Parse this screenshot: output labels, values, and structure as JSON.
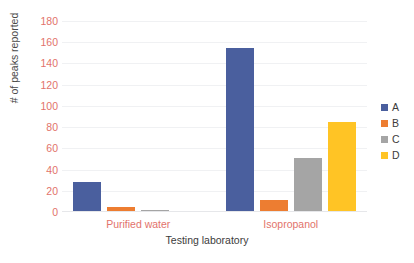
{
  "chart_data": {
    "type": "bar",
    "title": "",
    "xlabel": "Testing laboratory",
    "ylabel": "# of peaks reported",
    "categories": [
      "Purified water",
      "Isopropanol"
    ],
    "series": [
      {
        "name": "A",
        "color": "#4a5f9e",
        "values": [
          28,
          155
        ]
      },
      {
        "name": "B",
        "color": "#ed7d31",
        "values": [
          5,
          11
        ]
      },
      {
        "name": "C",
        "color": "#a5a5a5",
        "values": [
          1.5,
          51
        ]
      },
      {
        "name": "D",
        "color": "#ffc425",
        "values": [
          0.5,
          85
        ]
      }
    ],
    "ylim": [
      0,
      180
    ],
    "ytick_step": 20,
    "yticks": [
      180,
      160,
      140,
      120,
      100,
      80,
      60,
      40,
      20,
      0
    ],
    "ytick_labels": [
      "180",
      "160",
      "140",
      "120",
      "100",
      "80",
      "60",
      "40",
      "20",
      "0"
    ],
    "grid": true,
    "legend_position": "right",
    "legend_entries": [
      "A",
      "B",
      "C",
      "D"
    ],
    "axis_label_color": "#e2736b",
    "axis_title_color": "#3c3c3c",
    "grid_color": "#f0f1f3",
    "background": "#ffffff"
  }
}
